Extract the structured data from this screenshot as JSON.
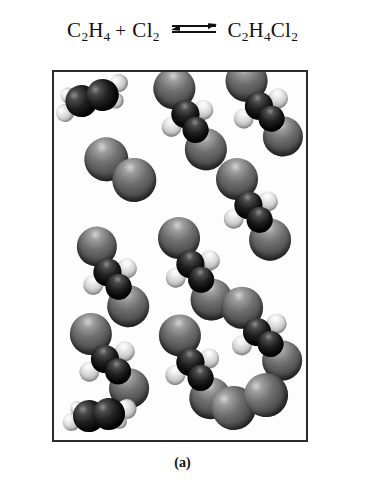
{
  "equation": {
    "reactant_1": {
      "formula": "C2H4",
      "parts": [
        {
          "t": "C"
        },
        {
          "sub": "2"
        },
        {
          "t": "H"
        },
        {
          "sub": "4"
        }
      ]
    },
    "plus": "+",
    "reactant_2": {
      "formula": "Cl2",
      "parts": [
        {
          "t": "Cl"
        },
        {
          "sub": "2"
        }
      ]
    },
    "arrow": "equilibrium-double-arrow",
    "product": {
      "formula": "C2H4Cl2",
      "parts": [
        {
          "t": "C"
        },
        {
          "sub": "2"
        },
        {
          "t": "H"
        },
        {
          "sub": "4"
        },
        {
          "t": "Cl"
        },
        {
          "sub": "2"
        }
      ]
    },
    "r1_c": "C",
    "r1_sub2": "2",
    "r1_h": "H",
    "r1_sub4": "4",
    "r2_cl": "Cl",
    "r2_sub2": "2",
    "p_c": "C",
    "p_sub2": "2",
    "p_h": "H",
    "p_sub4": "4",
    "p_cl": "Cl",
    "p_sub2b": "2"
  },
  "caption": "(a)",
  "colors": {
    "carbon": "#141414",
    "chlorine": "#6e6e6e",
    "hydrogen": "#e8e8e8",
    "box_border": "#2c2c2c",
    "background": "#ffffff",
    "text": "#101010"
  },
  "box": {
    "label": "molecule-container",
    "width": 256,
    "height": 372
  },
  "legend": {
    "carbon_label": "carbon (dark sphere)",
    "chlorine_label": "chlorine (grey sphere)",
    "hydrogen_label": "hydrogen (white sphere)"
  },
  "molecules": [
    {
      "name": "ethene",
      "formula": "C2H4",
      "x": 38,
      "y": 26,
      "rot": -16,
      "atoms": [
        {
          "el": "h",
          "dx": -30,
          "dy": 7,
          "r": 9
        },
        {
          "el": "c",
          "dx": -11,
          "dy": 0,
          "r": 16
        },
        {
          "el": "c",
          "dx": 11,
          "dy": 0,
          "r": 16
        },
        {
          "el": "h",
          "dx": 30,
          "dy": -7,
          "r": 9
        },
        {
          "el": "h",
          "dx": -22,
          "dy": -9,
          "r": 8
        },
        {
          "el": "h",
          "dx": 22,
          "dy": 9,
          "r": 8
        }
      ]
    },
    {
      "name": "dichloroethane",
      "formula": "C2H4Cl2",
      "x": 135,
      "y": 42,
      "rot": 32,
      "atoms": [
        {
          "el": "cl",
          "dx": -26,
          "dy": -14,
          "r": 21
        },
        {
          "el": "c",
          "dx": -3,
          "dy": 2,
          "r": 14
        },
        {
          "el": "c",
          "dx": 14,
          "dy": 10,
          "r": 13
        },
        {
          "el": "cl",
          "dx": 33,
          "dy": 21,
          "r": 21
        },
        {
          "el": "h",
          "dx": 10,
          "dy": -11,
          "r": 10
        },
        {
          "el": "h",
          "dx": -8,
          "dy": 20,
          "r": 10
        }
      ]
    },
    {
      "name": "dichloroethane",
      "formula": "C2H4Cl2",
      "x": 208,
      "y": 32,
      "rot": 26,
      "atoms": [
        {
          "el": "cl",
          "dx": -24,
          "dy": -14,
          "r": 21
        },
        {
          "el": "c",
          "dx": -2,
          "dy": 3,
          "r": 14
        },
        {
          "el": "c",
          "dx": 15,
          "dy": 9,
          "r": 13
        },
        {
          "el": "cl",
          "dx": 33,
          "dy": 20,
          "r": 20
        },
        {
          "el": "h",
          "dx": 12,
          "dy": -12,
          "r": 10
        },
        {
          "el": "h",
          "dx": -10,
          "dy": 21,
          "r": 10
        }
      ]
    },
    {
      "name": "chlorine",
      "formula": "Cl2",
      "x": 66,
      "y": 97,
      "rot": 18,
      "atoms": [
        {
          "el": "cl",
          "dx": -16,
          "dy": -5,
          "r": 22
        },
        {
          "el": "cl",
          "dx": 17,
          "dy": 6,
          "r": 22
        }
      ]
    },
    {
      "name": "dichloroethane",
      "formula": "C2H4Cl2",
      "x": 198,
      "y": 133,
      "rot": 30,
      "atoms": [
        {
          "el": "cl",
          "dx": -26,
          "dy": -15,
          "r": 21
        },
        {
          "el": "c",
          "dx": -3,
          "dy": 2,
          "r": 14
        },
        {
          "el": "c",
          "dx": 14,
          "dy": 9,
          "r": 13
        },
        {
          "el": "cl",
          "dx": 33,
          "dy": 21,
          "r": 21
        },
        {
          "el": "h",
          "dx": 12,
          "dy": -11,
          "r": 10
        },
        {
          "el": "h",
          "dx": -9,
          "dy": 21,
          "r": 10
        }
      ]
    },
    {
      "name": "dichloroethane",
      "formula": "C2H4Cl2",
      "x": 57,
      "y": 200,
      "rot": 30,
      "atoms": [
        {
          "el": "cl",
          "dx": -25,
          "dy": -15,
          "r": 20
        },
        {
          "el": "c",
          "dx": -3,
          "dy": 2,
          "r": 14
        },
        {
          "el": "c",
          "dx": 14,
          "dy": 9,
          "r": 13
        },
        {
          "el": "cl",
          "dx": 32,
          "dy": 21,
          "r": 21
        },
        {
          "el": "h",
          "dx": 12,
          "dy": -11,
          "r": 10
        },
        {
          "el": "h",
          "dx": -9,
          "dy": 20,
          "r": 10
        }
      ]
    },
    {
      "name": "dichloroethane",
      "formula": "C2H4Cl2",
      "x": 140,
      "y": 192,
      "rot": 30,
      "atoms": [
        {
          "el": "cl",
          "dx": -26,
          "dy": -15,
          "r": 21
        },
        {
          "el": "c",
          "dx": -3,
          "dy": 2,
          "r": 14
        },
        {
          "el": "c",
          "dx": 14,
          "dy": 10,
          "r": 13
        },
        {
          "el": "cl",
          "dx": 33,
          "dy": 22,
          "r": 21
        },
        {
          "el": "h",
          "dx": 12,
          "dy": -11,
          "r": 10
        },
        {
          "el": "h",
          "dx": -9,
          "dy": 21,
          "r": 10
        }
      ]
    },
    {
      "name": "dichloroethane",
      "formula": "C2H4Cl2",
      "x": 54,
      "y": 285,
      "rot": 24,
      "atoms": [
        {
          "el": "cl",
          "dx": -25,
          "dy": -14,
          "r": 21
        },
        {
          "el": "c",
          "dx": -2,
          "dy": 3,
          "r": 14
        },
        {
          "el": "c",
          "dx": 15,
          "dy": 9,
          "r": 13
        },
        {
          "el": "cl",
          "dx": 32,
          "dy": 20,
          "r": 20
        },
        {
          "el": "h",
          "dx": 13,
          "dy": -12,
          "r": 10
        },
        {
          "el": "h",
          "dx": -11,
          "dy": 21,
          "r": 10
        }
      ]
    },
    {
      "name": "dichloroethane",
      "formula": "C2H4Cl2",
      "x": 140,
      "y": 290,
      "rot": 32,
      "atoms": [
        {
          "el": "cl",
          "dx": -26,
          "dy": -15,
          "r": 21
        },
        {
          "el": "c",
          "dx": -3,
          "dy": 2,
          "r": 14
        },
        {
          "el": "c",
          "dx": 14,
          "dy": 10,
          "r": 13
        },
        {
          "el": "cl",
          "dx": 33,
          "dy": 22,
          "r": 21
        },
        {
          "el": "h",
          "dx": 11,
          "dy": -11,
          "r": 10
        },
        {
          "el": "h",
          "dx": -9,
          "dy": 21,
          "r": 10
        }
      ]
    },
    {
      "name": "dichloroethane",
      "formula": "C2H4Cl2",
      "x": 206,
      "y": 258,
      "rot": 22,
      "atoms": [
        {
          "el": "cl",
          "dx": -25,
          "dy": -14,
          "r": 21
        },
        {
          "el": "c",
          "dx": -2,
          "dy": 3,
          "r": 14
        },
        {
          "el": "c",
          "dx": 15,
          "dy": 9,
          "r": 13
        },
        {
          "el": "cl",
          "dx": 32,
          "dy": 20,
          "r": 20
        },
        {
          "el": "h",
          "dx": 13,
          "dy": -12,
          "r": 10
        },
        {
          "el": "h",
          "dx": -11,
          "dy": 21,
          "r": 10
        }
      ]
    },
    {
      "name": "ethene",
      "formula": "C2H4",
      "x": 45,
      "y": 343,
      "rot": -6,
      "atoms": [
        {
          "el": "h",
          "dx": -28,
          "dy": 4,
          "r": 9
        },
        {
          "el": "c",
          "dx": -10,
          "dy": 0,
          "r": 16
        },
        {
          "el": "c",
          "dx": 10,
          "dy": 0,
          "r": 16
        },
        {
          "el": "h",
          "dx": 28,
          "dy": -3,
          "r": 10
        },
        {
          "el": "h",
          "dx": -21,
          "dy": -9,
          "r": 7
        },
        {
          "el": "h",
          "dx": 20,
          "dy": 9,
          "r": 7
        }
      ]
    },
    {
      "name": "chlorine",
      "formula": "Cl2",
      "x": 196,
      "y": 330,
      "rot": -10,
      "atoms": [
        {
          "el": "cl",
          "dx": -17,
          "dy": 3,
          "r": 22
        },
        {
          "el": "cl",
          "dx": 17,
          "dy": -4,
          "r": 22
        }
      ]
    }
  ]
}
